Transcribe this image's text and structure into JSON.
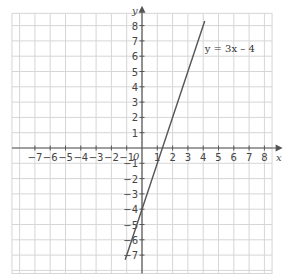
{
  "chart_data": {
    "type": "line",
    "title": "",
    "xlabel": "x",
    "ylabel": "y",
    "origin_label": "0",
    "xlim": [
      -8,
      8.7
    ],
    "ylim": [
      -8,
      8.7
    ],
    "x_ticks": [
      -7,
      -6,
      -5,
      -4,
      -3,
      -2,
      -1,
      1,
      2,
      3,
      4,
      5,
      6,
      7,
      8
    ],
    "y_ticks": [
      -7,
      -6,
      -5,
      -4,
      -3,
      -2,
      -1,
      1,
      2,
      3,
      4,
      5,
      6,
      7,
      8
    ],
    "grid": true,
    "series": [
      {
        "name": "y = 3x – 4",
        "equation": "y = 3x – 4",
        "slope": 3,
        "intercept": -4,
        "x": [
          -1.1,
          4.1
        ],
        "y": [
          -7.3,
          8.3
        ],
        "color": "#555555"
      }
    ],
    "annotations": [
      {
        "text": "y = 3x – 4",
        "x": 4.1,
        "y": 6.3
      }
    ]
  },
  "colors": {
    "grid": "#d6d6d6",
    "axis": "#555555",
    "line": "#555555"
  }
}
